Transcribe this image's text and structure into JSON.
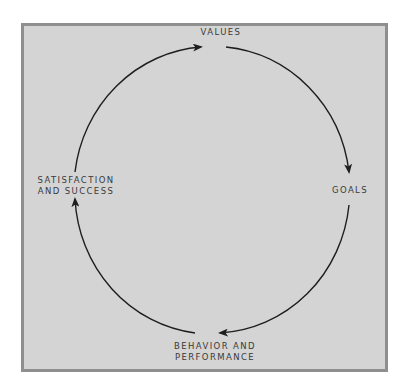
{
  "diagram": {
    "type": "cycle",
    "direction": "clockwise",
    "colors": {
      "background": "#ffffff",
      "panel_fill": "#d4d4d4",
      "panel_border": "#8f8f8f",
      "arrow": "#1e1e1e",
      "text": "#3a3a3a"
    },
    "nodes": [
      {
        "id": "values",
        "lines": [
          "VALUES"
        ]
      },
      {
        "id": "goals",
        "lines": [
          "GOALS"
        ]
      },
      {
        "id": "behavior",
        "lines": [
          "BEHAVIOR AND",
          "PERFORMANCE"
        ]
      },
      {
        "id": "satisfaction",
        "lines": [
          "SATISFACTION",
          "AND SUCCESS"
        ]
      }
    ],
    "edges": [
      {
        "from": "values",
        "to": "goals"
      },
      {
        "from": "goals",
        "to": "behavior"
      },
      {
        "from": "behavior",
        "to": "satisfaction"
      },
      {
        "from": "satisfaction",
        "to": "values"
      }
    ]
  }
}
